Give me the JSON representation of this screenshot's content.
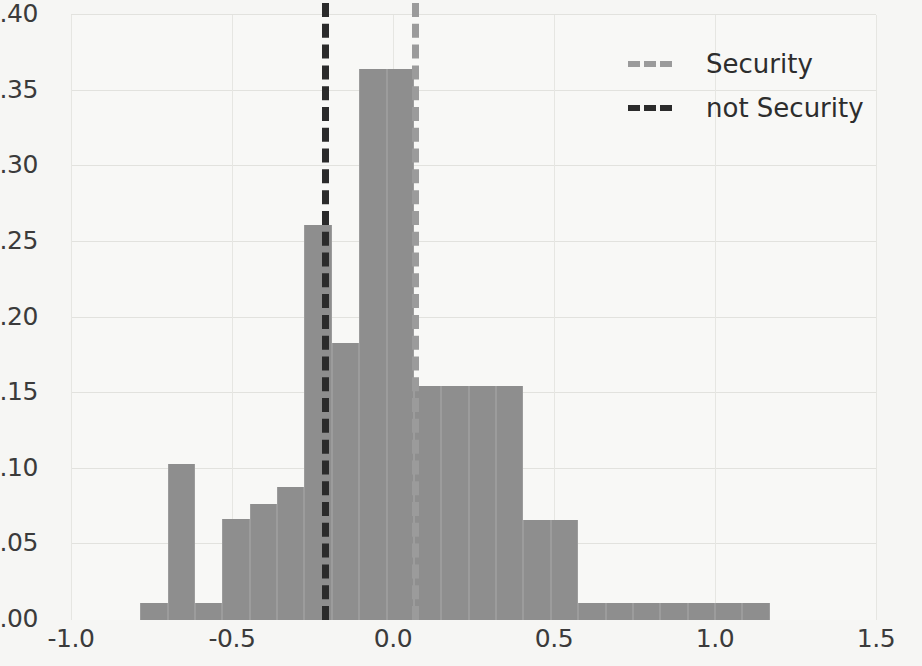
{
  "chart_data": {
    "type": "bar",
    "title": "",
    "xlabel": "",
    "ylabel": "",
    "xlim": [
      -1.0,
      1.5
    ],
    "ylim": [
      0.0,
      0.4
    ],
    "grid": true,
    "legend_position": "upper right",
    "xticks": [
      "-1.0",
      "-0.5",
      "0.0",
      "0.5",
      "1.0",
      "1.5"
    ],
    "xtick_values": [
      -1.0,
      -0.5,
      0.0,
      0.5,
      1.0,
      1.5
    ],
    "yticks": [
      "0.00",
      "0.05",
      "0.10",
      "0.15",
      "0.20",
      "0.25",
      "0.30",
      "0.35",
      "0.40"
    ],
    "ytick_values": [
      0.0,
      0.05,
      0.1,
      0.15,
      0.2,
      0.25,
      0.3,
      0.35,
      0.4
    ],
    "bar_color": "#8e8e8e",
    "bin_edges": [
      -0.785,
      -0.7,
      -0.615,
      -0.53,
      -0.445,
      -0.36,
      -0.275,
      -0.19,
      -0.105,
      -0.02,
      0.065,
      0.15,
      0.235,
      0.32,
      0.405,
      0.49,
      0.575,
      0.66,
      0.745,
      0.83,
      0.915,
      1.0,
      1.085,
      1.17
    ],
    "values": [
      0.011,
      0.103,
      0.011,
      0.067,
      0.077,
      0.088,
      0.261,
      0.183,
      0.364,
      0.364,
      0.155,
      0.155,
      0.155,
      0.155,
      0.066,
      0.066,
      0.011,
      0.011,
      0.011,
      0.011,
      0.011,
      0.011,
      0.011
    ],
    "vlines": [
      {
        "name": "not Security",
        "x": -0.22,
        "color": "#2b2b2b",
        "style": "dashed"
      },
      {
        "name": "Security",
        "x": 0.06,
        "color": "#9b9b9b",
        "style": "dashed"
      }
    ],
    "legend": [
      {
        "label": "Security",
        "color": "#9b9b9b",
        "style": "dashed"
      },
      {
        "label": "not Security",
        "color": "#2b2b2b",
        "style": "dashed"
      }
    ]
  }
}
